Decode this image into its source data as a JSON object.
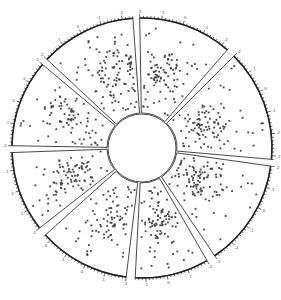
{
  "chart_data": {
    "type": "scatter",
    "layout": "radial-sector-scatter",
    "title": "",
    "center": [
      142,
      148
    ],
    "inner_radius": 34,
    "outer_radius": 130,
    "grid": false,
    "legend": null,
    "tick_labels_note": "tiny numeric tick labels along each outer arc (illegible at source resolution, approx. .2, .1, 0, .1, .2)",
    "tick_labels": [
      ".2",
      ".1",
      "0",
      ".1",
      ".2"
    ],
    "colors": {
      "dots": "#444444",
      "outline": "#333333",
      "axis": "#222222"
    },
    "sectors": [
      {
        "name": "sector-1",
        "start_deg": -47,
        "end_deg": -4,
        "points": 110,
        "seed": 11,
        "cluster_r": 0.55,
        "cluster_a": 0.7
      },
      {
        "name": "sector-2",
        "start_deg": -1,
        "end_deg": 41,
        "points": 95,
        "seed": 23,
        "cluster_r": 0.45,
        "cluster_a": 0.4
      },
      {
        "name": "sector-3",
        "start_deg": 45,
        "end_deg": 95,
        "points": 105,
        "seed": 37,
        "cluster_r": 0.35,
        "cluster_a": 0.5
      },
      {
        "name": "sector-4",
        "start_deg": 98,
        "end_deg": 146,
        "points": 110,
        "seed": 41,
        "cluster_r": 0.3,
        "cluster_a": 0.4
      },
      {
        "name": "sector-5",
        "start_deg": 150,
        "end_deg": 183,
        "points": 95,
        "seed": 53,
        "cluster_r": 0.4,
        "cluster_a": 0.5
      },
      {
        "name": "sector-6",
        "start_deg": 187,
        "end_deg": 228,
        "points": 85,
        "seed": 67,
        "cluster_r": 0.5,
        "cluster_a": 0.4
      },
      {
        "name": "sector-7",
        "start_deg": 232,
        "end_deg": 268,
        "points": 95,
        "seed": 79,
        "cluster_r": 0.45,
        "cluster_a": 0.5
      },
      {
        "name": "sector-8",
        "start_deg": 271,
        "end_deg": 310,
        "points": 85,
        "seed": 83,
        "cluster_r": 0.5,
        "cluster_a": 0.6
      }
    ]
  }
}
